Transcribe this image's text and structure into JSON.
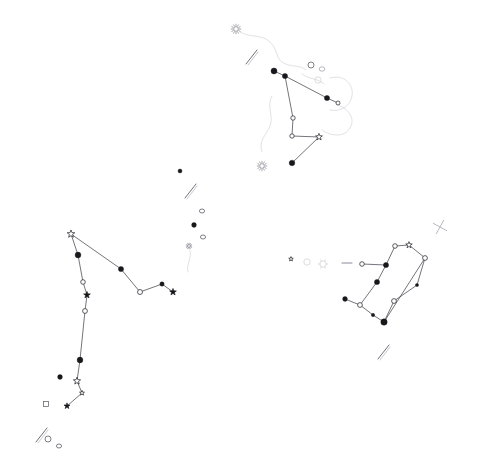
{
  "chart": {
    "background_color": "#ffffff",
    "line_color": "#3a3a42",
    "boundary_color": "#d9d9e0",
    "star_fill_color": "#17171c",
    "width": 480,
    "height": 472
  },
  "chart_data": {
    "type": "scatter",
    "xlabel": "",
    "ylabel": "",
    "xlim": [
      0,
      480
    ],
    "ylim": [
      0,
      472
    ],
    "grid": false,
    "legend": "none",
    "constellations": [
      {
        "name": "upper-constellation",
        "stars": [
          {
            "id": "u1",
            "x": 274,
            "y": 71,
            "marker": "filled-dot",
            "size": 3.0
          },
          {
            "id": "u2",
            "x": 285,
            "y": 76,
            "marker": "filled-dot",
            "size": 2.6
          },
          {
            "id": "u3",
            "x": 327,
            "y": 98,
            "marker": "filled-dot",
            "size": 2.6
          },
          {
            "id": "u4",
            "x": 338,
            "y": 103,
            "marker": "open-circle",
            "size": 2.0
          },
          {
            "id": "u5",
            "x": 293,
            "y": 118,
            "marker": "open-circle",
            "size": 2.2
          },
          {
            "id": "u6",
            "x": 292,
            "y": 136,
            "marker": "open-circle",
            "size": 2.2
          },
          {
            "id": "u7",
            "x": 319,
            "y": 137,
            "marker": "star-glyph",
            "size": 3.6
          },
          {
            "id": "u8",
            "x": 292,
            "y": 163,
            "marker": "filled-dot",
            "size": 2.8
          }
        ],
        "segments": [
          [
            "u1",
            "u2"
          ],
          [
            "u2",
            "u3"
          ],
          [
            "u3",
            "u4"
          ],
          [
            "u2",
            "u5"
          ],
          [
            "u5",
            "u6"
          ],
          [
            "u6",
            "u7"
          ],
          [
            "u7",
            "u8"
          ]
        ]
      },
      {
        "name": "left-constellation",
        "stars": [
          {
            "id": "l1",
            "x": 71,
            "y": 234,
            "marker": "star-glyph",
            "size": 4.0
          },
          {
            "id": "l2",
            "x": 78,
            "y": 255,
            "marker": "filled-dot",
            "size": 2.9
          },
          {
            "id": "l3",
            "x": 83,
            "y": 282,
            "marker": "open-circle",
            "size": 2.3
          },
          {
            "id": "l4",
            "x": 87,
            "y": 295,
            "marker": "star-glyph-filled",
            "size": 3.6
          },
          {
            "id": "l5",
            "x": 85,
            "y": 311,
            "marker": "open-circle",
            "size": 2.4
          },
          {
            "id": "l6",
            "x": 80,
            "y": 360,
            "marker": "filled-dot",
            "size": 2.9
          },
          {
            "id": "l7",
            "x": 77,
            "y": 381,
            "marker": "star-glyph",
            "size": 3.8
          },
          {
            "id": "l8",
            "x": 82,
            "y": 393,
            "marker": "star-glyph",
            "size": 2.6
          },
          {
            "id": "l9",
            "x": 67,
            "y": 406,
            "marker": "star-glyph-filled",
            "size": 3.2
          },
          {
            "id": "l10",
            "x": 121,
            "y": 269,
            "marker": "filled-dot",
            "size": 2.6
          },
          {
            "id": "l11",
            "x": 140,
            "y": 292,
            "marker": "open-circle",
            "size": 2.5
          },
          {
            "id": "l12",
            "x": 162,
            "y": 284,
            "marker": "filled-dot",
            "size": 2.2
          },
          {
            "id": "l13",
            "x": 173,
            "y": 292,
            "marker": "star-glyph-filled",
            "size": 3.6
          }
        ],
        "segments": [
          [
            "l1",
            "l2"
          ],
          [
            "l2",
            "l3"
          ],
          [
            "l3",
            "l4"
          ],
          [
            "l4",
            "l5"
          ],
          [
            "l5",
            "l6"
          ],
          [
            "l6",
            "l7"
          ],
          [
            "l7",
            "l8"
          ],
          [
            "l8",
            "l9"
          ],
          [
            "l1",
            "l10"
          ],
          [
            "l10",
            "l11"
          ],
          [
            "l11",
            "l12"
          ],
          [
            "l12",
            "l13"
          ]
        ]
      },
      {
        "name": "right-constellation",
        "stars": [
          {
            "id": "r1",
            "x": 395,
            "y": 246,
            "marker": "open-circle",
            "size": 2.3
          },
          {
            "id": "r2",
            "x": 409,
            "y": 245,
            "marker": "star-glyph",
            "size": 3.4
          },
          {
            "id": "r3",
            "x": 425,
            "y": 258,
            "marker": "open-circle",
            "size": 2.4
          },
          {
            "id": "r4",
            "x": 417,
            "y": 285,
            "marker": "dot-small",
            "size": 1.6
          },
          {
            "id": "r5",
            "x": 394,
            "y": 301,
            "marker": "open-circle",
            "size": 2.4
          },
          {
            "id": "r6",
            "x": 384,
            "y": 322,
            "marker": "filled-dot",
            "size": 3.2
          },
          {
            "id": "r7",
            "x": 373,
            "y": 315,
            "marker": "dot-small",
            "size": 1.7
          },
          {
            "id": "r8",
            "x": 360,
            "y": 305,
            "marker": "open-circle",
            "size": 2.4
          },
          {
            "id": "r9",
            "x": 345,
            "y": 299,
            "marker": "filled-dot",
            "size": 2.4
          },
          {
            "id": "r10",
            "x": 377,
            "y": 282,
            "marker": "filled-dot",
            "size": 2.6
          },
          {
            "id": "r11",
            "x": 386,
            "y": 265,
            "marker": "filled-dot",
            "size": 2.6
          },
          {
            "id": "r12",
            "x": 362,
            "y": 264,
            "marker": "open-circle",
            "size": 2.3
          }
        ],
        "segments": [
          [
            "r1",
            "r2"
          ],
          [
            "r2",
            "r3"
          ],
          [
            "r3",
            "r4"
          ],
          [
            "r4",
            "r5"
          ],
          [
            "r5",
            "r6"
          ],
          [
            "r6",
            "r7"
          ],
          [
            "r7",
            "r8"
          ],
          [
            "r8",
            "r9"
          ],
          [
            "r8",
            "r10"
          ],
          [
            "r10",
            "r11"
          ],
          [
            "r11",
            "r12"
          ],
          [
            "r11",
            "r1"
          ],
          [
            "r6",
            "r3"
          ]
        ]
      }
    ],
    "field_stars": [
      {
        "x": 180,
        "y": 171,
        "marker": "filled-dot",
        "size": 2.0
      },
      {
        "x": 194,
        "y": 225,
        "marker": "filled-dot",
        "size": 2.4
      },
      {
        "x": 60,
        "y": 377,
        "marker": "filled-dot",
        "size": 2.4
      },
      {
        "x": 291,
        "y": 259,
        "marker": "star-glyph",
        "size": 2.4
      }
    ],
    "deep_sky_objects": [
      {
        "x": 236,
        "y": 29,
        "type": "cluster",
        "style": "burst"
      },
      {
        "x": 262,
        "y": 166,
        "type": "cluster",
        "style": "burst"
      },
      {
        "x": 311,
        "y": 65,
        "type": "cluster",
        "style": "open-ring"
      },
      {
        "x": 322,
        "y": 69,
        "type": "galaxy",
        "style": "faint-ring"
      },
      {
        "x": 202,
        "y": 211,
        "type": "galaxy",
        "style": "small-ring"
      },
      {
        "x": 203,
        "y": 237,
        "type": "galaxy",
        "style": "small-ring"
      },
      {
        "x": 189,
        "y": 246,
        "type": "cluster",
        "style": "burst-small"
      },
      {
        "x": 191,
        "y": 191,
        "type": "galaxy-chain",
        "style": "streak"
      },
      {
        "x": 252,
        "y": 57,
        "type": "galaxy",
        "style": "streak"
      },
      {
        "x": 384,
        "y": 352,
        "type": "galaxy",
        "style": "streak"
      },
      {
        "x": 42,
        "y": 435,
        "type": "galaxy",
        "style": "streak"
      },
      {
        "x": 48,
        "y": 439,
        "type": "planetary",
        "style": "open-ring"
      },
      {
        "x": 59,
        "y": 446,
        "type": "galaxy",
        "style": "small-ring"
      },
      {
        "x": 46,
        "y": 404,
        "type": "galaxy",
        "style": "square"
      },
      {
        "x": 440,
        "y": 227,
        "type": "asterism",
        "style": "faint-star"
      },
      {
        "x": 307,
        "y": 262,
        "type": "nebula",
        "style": "ghost"
      },
      {
        "x": 323,
        "y": 264,
        "type": "nebula",
        "style": "ghost-star"
      },
      {
        "x": 347,
        "y": 263,
        "type": "bar",
        "style": "dash"
      },
      {
        "x": 318,
        "y": 80,
        "type": "galaxy",
        "style": "ghost"
      }
    ],
    "boundary_curves": [
      "M 240 32 C 250 38 262 34 270 42 C 278 50 276 58 282 62 C 290 68 300 64 306 70",
      "M 330 78 C 344 74 354 84 352 96 C 350 108 338 112 330 110",
      "M 336 104 C 348 108 356 118 350 128 C 344 138 330 136 322 130",
      "M 272 96 C 266 106 274 116 270 126 C 266 136 258 140 262 152",
      "M 302 74 C 310 80 318 78 324 84",
      "M 190 250 C 192 258 186 264 188 272"
    ]
  }
}
